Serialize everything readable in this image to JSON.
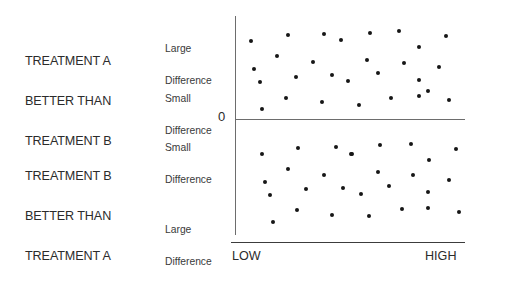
{
  "captions": {
    "top": [
      "TREATMENT A",
      "BETTER THAN",
      "TREATMENT B"
    ],
    "bottom": [
      "TREATMENT B",
      "BETTER THAN",
      "TREATMENT A"
    ]
  },
  "axis": {
    "zero_label": "0",
    "tier_large_top": [
      "Large",
      "Difference"
    ],
    "tier_small_top": [
      "Small",
      "Difference"
    ],
    "tier_small_bottom": [
      "Small",
      "Difference"
    ],
    "tier_large_bottom": [
      "Large",
      "Difference"
    ],
    "x_low_label": "LOW",
    "x_high_label": "HIGH"
  },
  "colors": {
    "background": "#ffffff",
    "dot": "#161616",
    "axis_line": "#6d6d6d",
    "x_axis_line": "#3c3c3c",
    "text": "#2b2b2b"
  },
  "chart_data": {
    "type": "scatter",
    "title": "",
    "xlabel": "",
    "ylabel": "",
    "grid": false,
    "legend": "none",
    "xlim": [
      0,
      1
    ],
    "ylim": [
      -1,
      1
    ],
    "xtick_labels": [
      "LOW",
      "HIGH"
    ],
    "ytick_labels": [
      "Large Difference",
      "Small Difference",
      "0",
      "Small Difference",
      "Large Difference"
    ],
    "annotations": [
      "TREATMENT A BETTER THAN TREATMENT B",
      "TREATMENT B BETTER THAN TREATMENT A"
    ],
    "series": [
      {
        "name": "Treatment A better (above zero)",
        "points": [
          [
            251,
            41
          ],
          [
            288,
            35
          ],
          [
            324,
            34
          ],
          [
            341,
            40
          ],
          [
            277,
            56
          ],
          [
            313,
            62
          ],
          [
            254,
            69
          ],
          [
            296,
            77
          ],
          [
            332,
            75
          ],
          [
            260,
            82
          ],
          [
            348,
            81
          ],
          [
            286,
            98
          ],
          [
            322,
            102
          ],
          [
            262,
            109
          ],
          [
            370,
            33
          ],
          [
            399,
            31
          ],
          [
            446,
            36
          ],
          [
            419,
            47
          ],
          [
            367,
            60
          ],
          [
            404,
            63
          ],
          [
            439,
            67
          ],
          [
            378,
            73
          ],
          [
            419,
            80
          ],
          [
            428,
            91
          ],
          [
            391,
            98
          ],
          [
            419,
            96
          ],
          [
            449,
            100
          ],
          [
            359,
            105
          ]
        ]
      },
      {
        "name": "Treatment B better (below zero)",
        "points": [
          [
            262,
            154
          ],
          [
            298,
            148
          ],
          [
            336,
            147
          ],
          [
            352,
            154
          ],
          [
            288,
            169
          ],
          [
            324,
            175
          ],
          [
            265,
            182
          ],
          [
            306,
            189
          ],
          [
            343,
            188
          ],
          [
            270,
            195
          ],
          [
            297,
            210
          ],
          [
            332,
            215
          ],
          [
            273,
            222
          ],
          [
            351,
            154
          ],
          [
            380,
            145
          ],
          [
            411,
            144
          ],
          [
            456,
            149
          ],
          [
            429,
            160
          ],
          [
            378,
            172
          ],
          [
            413,
            175
          ],
          [
            449,
            180
          ],
          [
            389,
            186
          ],
          [
            361,
            194
          ],
          [
            428,
            192
          ],
          [
            402,
            209
          ],
          [
            428,
            208
          ],
          [
            369,
            216
          ],
          [
            459,
            212
          ]
        ]
      }
    ]
  }
}
